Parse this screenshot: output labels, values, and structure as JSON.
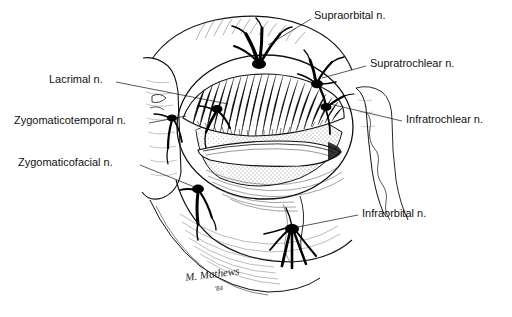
{
  "figure": {
    "background_color": "#ffffff",
    "ink_color": "#000000"
  },
  "labels": [
    {
      "id": "supraorbital",
      "text": "Supraorbital n.",
      "side": "right",
      "x": 314,
      "y": 10,
      "leader": {
        "x1": 311,
        "y1": 19,
        "x2": 268,
        "y2": 45
      }
    },
    {
      "id": "supratrochlear",
      "text": "Supratrochlear n.",
      "side": "right",
      "x": 370,
      "y": 58,
      "leader": {
        "x1": 366,
        "y1": 66,
        "x2": 322,
        "y2": 78
      }
    },
    {
      "id": "infratrochlear",
      "text": "Infratrochlear n.",
      "side": "right",
      "x": 406,
      "y": 114,
      "leader": {
        "x1": 402,
        "y1": 121,
        "x2": 330,
        "y2": 104
      }
    },
    {
      "id": "infraorbital",
      "text": "Infraorbital n.",
      "side": "right",
      "x": 362,
      "y": 208,
      "leader": {
        "x1": 358,
        "y1": 215,
        "x2": 293,
        "y2": 228
      }
    },
    {
      "id": "lacrimal",
      "text": "Lacrimal n.",
      "side": "left",
      "x": 49,
      "y": 74,
      "leader": {
        "x1": 116,
        "y1": 82,
        "x2": 228,
        "y2": 104
      }
    },
    {
      "id": "zygomaticotemporal",
      "text": "Zygomaticotemporal n.",
      "side": "left",
      "x": 14,
      "y": 115,
      "leader": {
        "x1": 149,
        "y1": 123,
        "x2": 186,
        "y2": 116
      }
    },
    {
      "id": "zygomaticofacial",
      "text": "Zygomaticofacial n.",
      "side": "left",
      "x": 18,
      "y": 157,
      "leader": {
        "x1": 140,
        "y1": 165,
        "x2": 197,
        "y2": 188
      }
    }
  ],
  "signature": {
    "artist": "M. Mathews",
    "year": "'84",
    "x": 186,
    "y": 283
  }
}
